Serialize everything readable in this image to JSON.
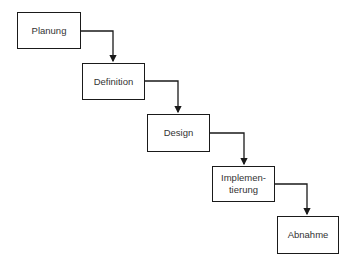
{
  "diagram": {
    "type": "waterfall-process",
    "steps": [
      {
        "label": "Planung",
        "x": 17,
        "y": 12,
        "w": 64,
        "h": 37
      },
      {
        "label": "Definition",
        "x": 82,
        "y": 63,
        "w": 63,
        "h": 37
      },
      {
        "label": "Design",
        "x": 147,
        "y": 114,
        "w": 63,
        "h": 38
      },
      {
        "label": "Implemen-\ntierung",
        "x": 212,
        "y": 166,
        "w": 63,
        "h": 36
      },
      {
        "label": "Abnahme",
        "x": 277,
        "y": 216,
        "w": 62,
        "h": 38
      }
    ],
    "connectors": [
      {
        "from": "Planung",
        "to": "Definition"
      },
      {
        "from": "Definition",
        "to": "Design"
      },
      {
        "from": "Design",
        "to": "Implementierung"
      },
      {
        "from": "Implementierung",
        "to": "Abnahme"
      }
    ],
    "colors": {
      "line": "#1a1a1a",
      "text": "#333333",
      "background": "#ffffff"
    }
  }
}
